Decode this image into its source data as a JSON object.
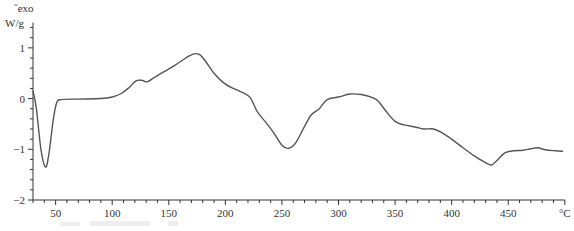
{
  "chart_data": {
    "type": "line",
    "title": "",
    "xlabel": "°C",
    "ylabel": "W/g",
    "y_annotation": "ˆexo",
    "xlim": [
      30,
      500
    ],
    "ylim": [
      -2,
      1.5
    ],
    "x_ticks": [
      50,
      100,
      150,
      200,
      250,
      300,
      350,
      400,
      450
    ],
    "x_tick_labels": [
      "50",
      "100",
      "150",
      "200",
      "250",
      "300",
      "350",
      "400",
      "450"
    ],
    "x_minor_step": 10,
    "y_ticks": [
      -2,
      -1,
      0,
      1
    ],
    "y_tick_labels": [
      "−2",
      "−1",
      "0",
      "1"
    ],
    "y_minor_step": 0.2,
    "grid": false,
    "legend": "none",
    "line_color": "#555555",
    "series": [
      {
        "name": "DSC heat flow",
        "x": [
          30,
          33,
          37,
          41,
          44,
          48,
          51,
          55,
          70,
          90,
          100,
          108,
          115,
          121,
          126,
          131,
          136,
          145,
          155,
          165,
          172,
          177,
          182,
          190,
          198,
          205,
          215,
          222,
          228,
          235,
          242,
          250,
          256,
          262,
          270,
          276,
          283,
          290,
          300,
          310,
          320,
          330,
          335,
          342,
          350,
          358,
          368,
          375,
          384,
          392,
          400,
          410,
          420,
          428,
          435,
          440,
          447,
          455,
          463,
          470,
          476,
          483,
          492,
          498
        ],
        "y": [
          0.15,
          -0.2,
          -1.0,
          -1.35,
          -1.1,
          -0.4,
          -0.08,
          -0.02,
          -0.01,
          0.0,
          0.03,
          0.1,
          0.22,
          0.35,
          0.36,
          0.33,
          0.4,
          0.52,
          0.65,
          0.8,
          0.88,
          0.87,
          0.75,
          0.5,
          0.32,
          0.22,
          0.12,
          0.02,
          -0.25,
          -0.45,
          -0.65,
          -0.92,
          -0.98,
          -0.88,
          -0.55,
          -0.32,
          -0.2,
          -0.02,
          0.03,
          0.09,
          0.08,
          0.02,
          -0.05,
          -0.25,
          -0.45,
          -0.52,
          -0.56,
          -0.6,
          -0.6,
          -0.68,
          -0.8,
          -0.97,
          -1.13,
          -1.24,
          -1.31,
          -1.22,
          -1.07,
          -1.03,
          -1.02,
          -0.99,
          -0.97,
          -1.01,
          -1.03,
          -1.04
        ]
      }
    ]
  }
}
